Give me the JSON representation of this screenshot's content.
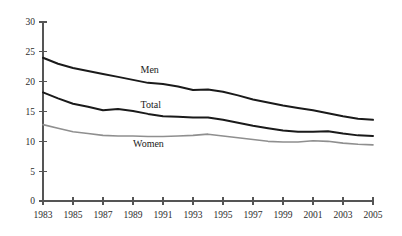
{
  "chart_data": {
    "type": "line",
    "title": "",
    "subtitle": "",
    "xlabel": "",
    "ylabel": "",
    "xlim": [
      1983,
      2005
    ],
    "ylim": [
      0,
      30
    ],
    "grid": false,
    "legend_position": "inline-labels",
    "x": [
      1983,
      1984,
      1985,
      1986,
      1987,
      1988,
      1989,
      1990,
      1991,
      1992,
      1993,
      1994,
      1995,
      1996,
      1997,
      1998,
      1999,
      2000,
      2001,
      2002,
      2003,
      2004,
      2005
    ],
    "x_tick_labels": [
      "1983",
      "1985",
      "1987",
      "1989",
      "1991",
      "1993",
      "1995",
      "1997",
      "1999",
      "2001",
      "2003",
      "2005"
    ],
    "y_tick_labels": [
      "0",
      "5",
      "10",
      "15",
      "20",
      "25",
      "30"
    ],
    "y_ticks": [
      0,
      5,
      10,
      15,
      20,
      25,
      30
    ],
    "series": [
      {
        "name": "Men",
        "color": "#1a1a1a",
        "stroke_width": 2.0,
        "label": "Men",
        "label_x": 1989.5,
        "label_y": 21.5,
        "values": [
          24.0,
          23.0,
          22.3,
          21.8,
          21.3,
          20.8,
          20.3,
          19.8,
          19.6,
          19.2,
          18.6,
          18.7,
          18.3,
          17.7,
          17.0,
          16.5,
          16.0,
          15.6,
          15.2,
          14.7,
          14.2,
          13.8,
          13.6
        ]
      },
      {
        "name": "Total",
        "color": "#1a1a1a",
        "stroke_width": 2.0,
        "label": "Total",
        "label_x": 1989.5,
        "label_y": 15.6,
        "values": [
          18.2,
          17.2,
          16.3,
          15.8,
          15.2,
          15.4,
          15.1,
          14.6,
          14.2,
          14.1,
          14.0,
          14.0,
          13.6,
          13.1,
          12.6,
          12.2,
          11.8,
          11.6,
          11.6,
          11.7,
          11.3,
          11.0,
          10.9
        ]
      },
      {
        "name": "Women",
        "color": "#8f8f8f",
        "stroke_width": 1.6,
        "label": "Women",
        "label_x": 1989.0,
        "label_y": 9.0,
        "values": [
          12.8,
          12.2,
          11.6,
          11.3,
          11.0,
          10.9,
          10.9,
          10.8,
          10.8,
          10.9,
          11.0,
          11.2,
          10.9,
          10.6,
          10.3,
          10.0,
          9.9,
          9.9,
          10.1,
          10.0,
          9.7,
          9.5,
          9.4
        ]
      }
    ]
  },
  "chart_geometry": {
    "plot_left": 43,
    "plot_right": 373,
    "plot_top": 22,
    "plot_bottom": 201
  }
}
